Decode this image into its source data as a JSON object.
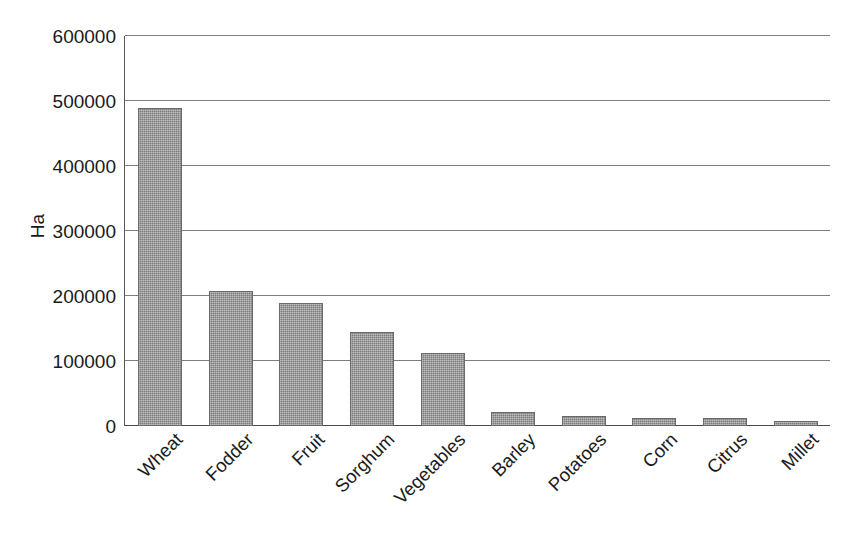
{
  "chart_data": {
    "type": "bar",
    "title": "",
    "subtitle": "",
    "xlabel": "",
    "ylabel": "Ha",
    "categories": [
      "Wheat",
      "Fodder",
      "Fruit",
      "Sorghum",
      "Vegetables",
      "Barley",
      "Potatoes",
      "Corn",
      "Citrus",
      "Millet"
    ],
    "values": [
      490000,
      208000,
      190000,
      145000,
      113000,
      22000,
      16000,
      13000,
      13000,
      7000
    ],
    "ylim": [
      0,
      600000
    ],
    "y_ticks": [
      0,
      100000,
      200000,
      300000,
      400000,
      500000,
      600000
    ],
    "y_tick_labels": [
      "0",
      "100000",
      "200000",
      "300000",
      "400000",
      "500000",
      "600000"
    ],
    "grid": true,
    "legend": false,
    "legend_position": "none",
    "bar_color": "#7b7b7b",
    "bar_edge_color": "#6b6b6b",
    "gridline_color": "#7d7d7d",
    "axis_color": "#5a5a5a",
    "background_color": "#ffffff",
    "text_color": "#1a1a1a"
  }
}
